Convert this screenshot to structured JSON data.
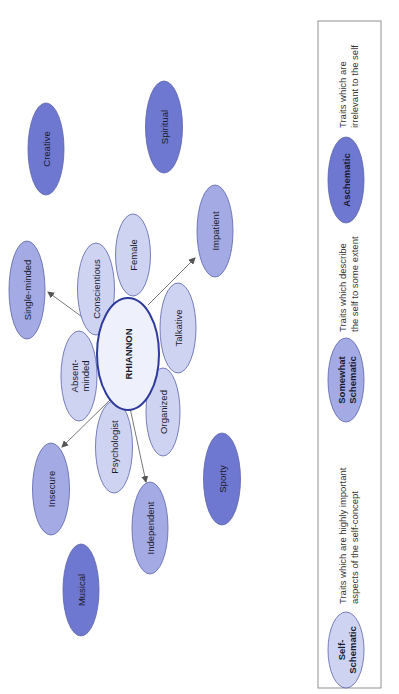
{
  "diagram": {
    "orientation": "rotated-90-ccw",
    "colors": {
      "self_schematic_fill": "#cfd3f2",
      "somewhat_schematic_fill": "#a4abe4",
      "aschematic_fill": "#6e78d0",
      "ellipse_stroke": "#5a62a8",
      "center_stroke": "#2e3a9c",
      "center_fill": "#eef0fb",
      "arrow": "#555555",
      "legend_border": "#777777"
    },
    "center": {
      "label": "RHIANNON"
    },
    "self_schematic_traits": [
      {
        "id": "conscientious",
        "lines": [
          "Conscientious"
        ]
      },
      {
        "id": "female",
        "lines": [
          "Female"
        ]
      },
      {
        "id": "talkative",
        "lines": [
          "Talkative"
        ]
      },
      {
        "id": "organized",
        "lines": [
          "Organized"
        ]
      },
      {
        "id": "psychologist",
        "lines": [
          "Psychologist"
        ]
      },
      {
        "id": "absent-minded",
        "lines": [
          "Absent-",
          "minded"
        ]
      }
    ],
    "somewhat_schematic_traits": [
      {
        "id": "single-minded",
        "lines": [
          "Single-minded"
        ]
      },
      {
        "id": "impatient",
        "lines": [
          "Impatient"
        ]
      },
      {
        "id": "insecure",
        "lines": [
          "Insecure"
        ]
      },
      {
        "id": "independent",
        "lines": [
          "Independent"
        ]
      }
    ],
    "aschematic_traits": [
      {
        "id": "creative",
        "lines": [
          "Creative"
        ]
      },
      {
        "id": "spiritual",
        "lines": [
          "Spiritual"
        ]
      },
      {
        "id": "sporty",
        "lines": [
          "Sporty"
        ]
      },
      {
        "id": "musical",
        "lines": [
          "Musical"
        ]
      }
    ]
  },
  "legend": {
    "items": [
      {
        "label_lines": [
          "Self-",
          "Schematic"
        ],
        "description_lines": [
          "Traits which are highly important",
          "aspects of the self-concept"
        ]
      },
      {
        "label_lines": [
          "Somewhat",
          "Schematic"
        ],
        "description_lines": [
          "Traits which describe",
          "the self to some extent"
        ]
      },
      {
        "label_lines": [
          "Aschematic"
        ],
        "description_lines": [
          "Traits which are",
          "irrelevant to the self"
        ]
      }
    ]
  }
}
